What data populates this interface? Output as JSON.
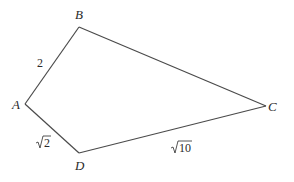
{
  "diagram": {
    "type": "quadrilateral",
    "vertices": {
      "A": {
        "label": "A",
        "x": 25,
        "y": 104
      },
      "B": {
        "label": "B",
        "x": 79,
        "y": 27
      },
      "C": {
        "label": "C",
        "x": 266,
        "y": 106
      },
      "D": {
        "label": "D",
        "x": 79,
        "y": 153
      }
    },
    "edges": [
      {
        "from": "A",
        "to": "B",
        "label": "2"
      },
      {
        "from": "B",
        "to": "C",
        "label": ""
      },
      {
        "from": "C",
        "to": "D",
        "label": "10",
        "radical": true
      },
      {
        "from": "D",
        "to": "A",
        "label": "2",
        "radical": true
      }
    ],
    "colors": {
      "stroke": "#4a4a4a",
      "text": "#2a2a2a",
      "background": "#ffffff"
    }
  }
}
